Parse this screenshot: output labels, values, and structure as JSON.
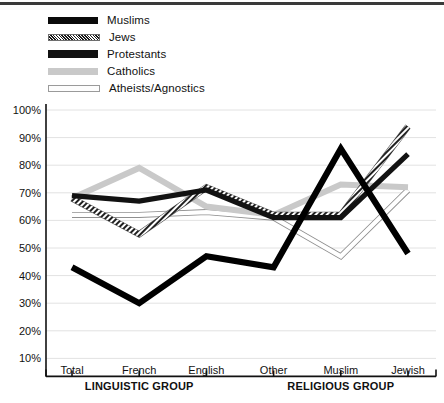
{
  "chart_data": {
    "type": "line",
    "title": "",
    "xlabel": "",
    "ylabel": "",
    "categories": [
      "Total",
      "French",
      "English",
      "Other",
      "Muslim",
      "Jewish"
    ],
    "category_groups": [
      {
        "label": "LINGUISTIC GROUP",
        "categories": [
          "Total",
          "French",
          "English"
        ]
      },
      {
        "label": "RELIGIOUS GROUP",
        "categories": [
          "Other",
          "Muslim",
          "Jewish"
        ]
      }
    ],
    "ylim": [
      0,
      100
    ],
    "ytick_labels": [
      "100%",
      "90%",
      "80%",
      "70%",
      "60%",
      "50%",
      "40%",
      "30%",
      "20%",
      "10%"
    ],
    "ytick_values": [
      100,
      90,
      80,
      70,
      60,
      50,
      40,
      30,
      20,
      10
    ],
    "grid": true,
    "legend_position": "top-left",
    "series": [
      {
        "name": "Muslims",
        "values": [
          43,
          30,
          47,
          43,
          86,
          48
        ],
        "style": "solid-thick-black",
        "color": "#0a0a0a"
      },
      {
        "name": "Jews",
        "values": [
          68,
          55,
          72,
          62,
          62,
          94
        ],
        "style": "hatched",
        "color": "#1a1a1a"
      },
      {
        "name": "Protestants",
        "values": [
          69,
          67,
          71,
          61,
          61,
          84
        ],
        "style": "solid-thick-black",
        "color": "#111111"
      },
      {
        "name": "Catholics",
        "values": [
          68,
          79,
          65,
          62,
          73,
          72
        ],
        "style": "solid-light-gray",
        "color": "#c9c9c9"
      },
      {
        "name": "Atheists/Agnostics",
        "values": [
          62,
          62,
          63,
          61,
          47,
          71
        ],
        "style": "outline-white",
        "color": "#fdfdfd"
      }
    ]
  },
  "legend": {
    "items": [
      {
        "label": "Muslims"
      },
      {
        "label": "Jews"
      },
      {
        "label": "Protestants"
      },
      {
        "label": "Catholics"
      },
      {
        "label": "Atheists/Agnostics"
      }
    ]
  }
}
